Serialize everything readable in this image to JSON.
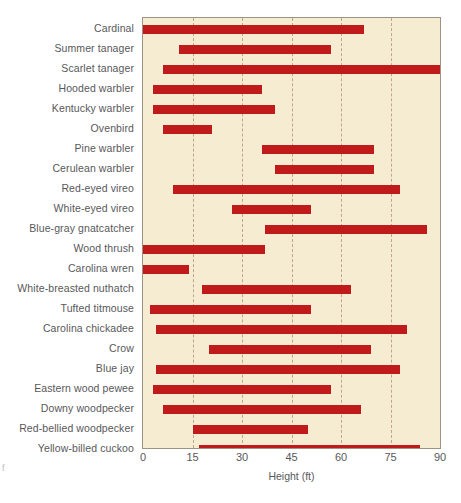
{
  "chart_data": {
    "type": "bar",
    "orientation": "horizontal",
    "subtype": "range-bar",
    "title": "",
    "xlabel": "Height (ft)",
    "ylabel": "",
    "xlim": [
      0,
      90
    ],
    "xticks": [
      0,
      15,
      30,
      45,
      60,
      75,
      90
    ],
    "xtick_labels": [
      "0",
      "15",
      "30",
      "45",
      "60",
      "75",
      "90"
    ],
    "grid": "vertical-dashed",
    "legend": "none",
    "bar_color": "#c01a1a",
    "plot_background": "#f6ecd2",
    "categories": [
      "Cardinal",
      "Summer tanager",
      "Scarlet tanager",
      "Hooded warbler",
      "Kentucky warbler",
      "Ovenbird",
      "Pine warbler",
      "Cerulean warbler",
      "Red-eyed vireo",
      "White-eyed vireo",
      "Blue-gray gnatcatcher",
      "Wood thrush",
      "Carolina wren",
      "White-breasted nuthatch",
      "Tufted titmouse",
      "Carolina chickadee",
      "Crow",
      "Blue jay",
      "Eastern wood pewee",
      "Downy woodpecker",
      "Red-bellied woodpecker",
      "Yellow-billed cuckoo"
    ],
    "ranges": [
      {
        "label": "Cardinal",
        "start": 0,
        "end": 67
      },
      {
        "label": "Summer tanager",
        "start": 11,
        "end": 57
      },
      {
        "label": "Scarlet tanager",
        "start": 6,
        "end": 90
      },
      {
        "label": "Hooded warbler",
        "start": 3,
        "end": 36
      },
      {
        "label": "Kentucky warbler",
        "start": 3,
        "end": 40
      },
      {
        "label": "Ovenbird",
        "start": 6,
        "end": 21
      },
      {
        "label": "Pine warbler",
        "start": 36,
        "end": 70
      },
      {
        "label": "Cerulean warbler",
        "start": 40,
        "end": 70
      },
      {
        "label": "Red-eyed vireo",
        "start": 9,
        "end": 78
      },
      {
        "label": "White-eyed vireo",
        "start": 27,
        "end": 51
      },
      {
        "label": "Blue-gray gnatcatcher",
        "start": 37,
        "end": 86
      },
      {
        "label": "Wood thrush",
        "start": 0,
        "end": 37
      },
      {
        "label": "Carolina wren",
        "start": 0,
        "end": 14
      },
      {
        "label": "White-breasted nuthatch",
        "start": 18,
        "end": 63
      },
      {
        "label": "Tufted titmouse",
        "start": 2,
        "end": 51
      },
      {
        "label": "Carolina chickadee",
        "start": 4,
        "end": 80
      },
      {
        "label": "Crow",
        "start": 20,
        "end": 69
      },
      {
        "label": "Blue jay",
        "start": 4,
        "end": 78
      },
      {
        "label": "Eastern wood pewee",
        "start": 3,
        "end": 57
      },
      {
        "label": "Downy woodpecker",
        "start": 6,
        "end": 66
      },
      {
        "label": "Red-bellied woodpecker",
        "start": 15,
        "end": 50
      },
      {
        "label": "Yellow-billed cuckoo",
        "start": 17,
        "end": 84
      }
    ]
  }
}
